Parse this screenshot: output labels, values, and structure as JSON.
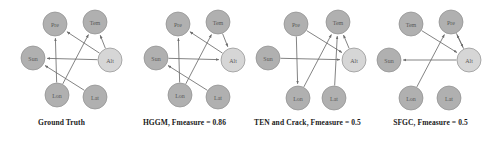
{
  "figure": {
    "title": "",
    "background": "#ffffff",
    "node_fill_default": "#b0b0b0",
    "node_fill_light": "#d6d6d6",
    "node_stroke": "#8e8e8e",
    "edge_color": "#6d6d6d",
    "label_color": "#5a5a5a",
    "caption_color": "#1a1a1a"
  },
  "chart_data": {
    "type": "diagram",
    "subtype": "directed-graph-comparison",
    "node_names": [
      "Pre",
      "Tem",
      "Sun",
      "Alt",
      "Lon",
      "Lat"
    ],
    "panels": [
      {
        "id": "ground-truth",
        "caption": "Ground Truth",
        "x": 0,
        "width": 123,
        "nodes": [
          {
            "id": "Pre",
            "label": "Pre",
            "cx": 55,
            "cy": 24,
            "r": 12,
            "fill": "#b0b0b0"
          },
          {
            "id": "Tem",
            "label": "Tem",
            "cx": 95,
            "cy": 22,
            "r": 12,
            "fill": "#b0b0b0"
          },
          {
            "id": "Sun",
            "label": "Sun",
            "cx": 33,
            "cy": 58,
            "r": 12,
            "fill": "#b0b0b0"
          },
          {
            "id": "Alt",
            "label": "Alt",
            "cx": 110,
            "cy": 60,
            "r": 12,
            "fill": "#d6d6d6"
          },
          {
            "id": "Lon",
            "label": "Lon",
            "cx": 57,
            "cy": 95,
            "r": 12,
            "fill": "#b0b0b0"
          },
          {
            "id": "Lat",
            "label": "Lat",
            "cx": 95,
            "cy": 97,
            "r": 12,
            "fill": "#b0b0b0"
          }
        ],
        "edges": [
          {
            "from": "Lon",
            "to": "Pre",
            "arrow": true
          },
          {
            "from": "Alt",
            "to": "Pre",
            "arrow": true
          },
          {
            "from": "Alt",
            "to": "Tem",
            "arrow": true
          },
          {
            "from": "Lon",
            "to": "Tem",
            "arrow": true
          },
          {
            "from": "Alt",
            "to": "Sun",
            "arrow": true
          },
          {
            "from": "Lat",
            "to": "Sun",
            "arrow": true
          }
        ]
      },
      {
        "id": "hggm",
        "caption": "HGGM, Fmeasure = 0.86",
        "x": 123,
        "width": 123,
        "nodes": [
          {
            "id": "Pre",
            "label": "Pre",
            "cx": 55,
            "cy": 24,
            "r": 12,
            "fill": "#b0b0b0"
          },
          {
            "id": "Tem",
            "label": "Tem",
            "cx": 95,
            "cy": 22,
            "r": 12,
            "fill": "#b0b0b0"
          },
          {
            "id": "Sun",
            "label": "Sun",
            "cx": 33,
            "cy": 58,
            "r": 12,
            "fill": "#b0b0b0"
          },
          {
            "id": "Alt",
            "label": "Alt",
            "cx": 110,
            "cy": 60,
            "r": 12,
            "fill": "#d6d6d6"
          },
          {
            "id": "Lon",
            "label": "Lon",
            "cx": 57,
            "cy": 95,
            "r": 12,
            "fill": "#b0b0b0"
          },
          {
            "id": "Lat",
            "label": "Lat",
            "cx": 95,
            "cy": 97,
            "r": 12,
            "fill": "#b0b0b0"
          }
        ],
        "edges": [
          {
            "from": "Lon",
            "to": "Pre",
            "arrow": true
          },
          {
            "from": "Alt",
            "to": "Pre",
            "arrow": true
          },
          {
            "from": "Lon",
            "to": "Tem",
            "arrow": true
          },
          {
            "from": "Tem",
            "to": "Alt",
            "arrow": true
          },
          {
            "from": "Sun",
            "to": "Alt",
            "arrow": true
          },
          {
            "from": "Lat",
            "to": "Sun",
            "arrow": true
          }
        ]
      },
      {
        "id": "ten-and-crack",
        "caption": "TEN and Crack, Fmeasure = 0.5",
        "x": 246,
        "width": 123,
        "nodes": [
          {
            "id": "Pre",
            "label": "Pre",
            "cx": 50,
            "cy": 24,
            "r": 12,
            "fill": "#b0b0b0"
          },
          {
            "id": "Tem",
            "label": "Tem",
            "cx": 92,
            "cy": 22,
            "r": 12,
            "fill": "#b0b0b0"
          },
          {
            "id": "Sun",
            "label": "Sun",
            "cx": 22,
            "cy": 58,
            "r": 12,
            "fill": "#b0b0b0"
          },
          {
            "id": "Alt",
            "label": "Alt",
            "cx": 108,
            "cy": 60,
            "r": 12,
            "fill": "#d6d6d6"
          },
          {
            "id": "Lon",
            "label": "Lon",
            "cx": 52,
            "cy": 98,
            "r": 12,
            "fill": "#b0b0b0"
          },
          {
            "id": "Lat",
            "label": "Lat",
            "cx": 88,
            "cy": 98,
            "r": 12,
            "fill": "#b0b0b0"
          }
        ],
        "edges": [
          {
            "from": "Pre",
            "to": "Lon",
            "arrow": true
          },
          {
            "from": "Pre",
            "to": "Alt",
            "arrow": true
          },
          {
            "from": "Lon",
            "to": "Tem",
            "arrow": true
          },
          {
            "from": "Lat",
            "to": "Tem",
            "arrow": true
          },
          {
            "from": "Alt",
            "to": "Tem",
            "arrow": true
          },
          {
            "from": "Sun",
            "to": "Alt",
            "arrow": true
          }
        ]
      },
      {
        "id": "sfgc",
        "caption": "SFGC, Fmeasure = 0.5",
        "x": 369,
        "width": 123,
        "nodes": [
          {
            "id": "Tem",
            "label": "Tem",
            "cx": 42,
            "cy": 24,
            "r": 12,
            "fill": "#b0b0b0"
          },
          {
            "id": "Pre",
            "label": "Pre",
            "cx": 82,
            "cy": 22,
            "r": 12,
            "fill": "#b0b0b0"
          },
          {
            "id": "Sun",
            "label": "Sun",
            "cx": 20,
            "cy": 60,
            "r": 12,
            "fill": "#b0b0b0"
          },
          {
            "id": "Alt",
            "label": "Alt",
            "cx": 100,
            "cy": 60,
            "r": 12,
            "fill": "#d6d6d6"
          },
          {
            "id": "Lon",
            "label": "Lon",
            "cx": 42,
            "cy": 98,
            "r": 12,
            "fill": "#b0b0b0"
          },
          {
            "id": "Lat",
            "label": "Lat",
            "cx": 80,
            "cy": 98,
            "r": 12,
            "fill": "#b0b0b0"
          }
        ],
        "edges": [
          {
            "from": "Tem",
            "to": "Alt",
            "arrow": true
          },
          {
            "from": "Lon",
            "to": "Pre",
            "arrow": true
          },
          {
            "from": "Alt",
            "to": "Pre",
            "arrow": true
          },
          {
            "from": "Pre",
            "to": "Alt",
            "arrow": true
          },
          {
            "from": "Alt",
            "to": "Sun",
            "arrow": true
          }
        ]
      }
    ]
  }
}
